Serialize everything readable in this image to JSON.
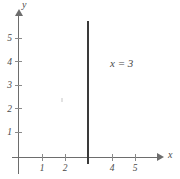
{
  "chart_data": {
    "type": "line",
    "title": "",
    "xlabel": "x",
    "ylabel": "y",
    "xlim": [
      0,
      6
    ],
    "ylim": [
      0,
      6
    ],
    "xticks": [
      1,
      2,
      3,
      4,
      5
    ],
    "xtick_labels": [
      "1",
      "2",
      "4",
      "5"
    ],
    "yticks": [
      1,
      2,
      3,
      4,
      5
    ],
    "ytick_labels": [
      "1",
      "2",
      "3",
      "4",
      "5"
    ],
    "grid": false,
    "legend": "none",
    "series": [
      {
        "name": "x = 3",
        "equation": "x = 3",
        "orientation": "vertical",
        "x_value": 3,
        "y_from": 0,
        "y_to": 5.8,
        "color": "#3a3a3a"
      }
    ],
    "annotations": [
      {
        "text": "x = 3",
        "x": 4,
        "y": 4
      }
    ]
  },
  "figure": {
    "axes": {
      "x_name": "x",
      "y_name": "y"
    },
    "x_tick_labels": [
      {
        "label": "1",
        "left": 36
      },
      {
        "label": "2",
        "left": 59
      },
      {
        "label": "4",
        "left": 106
      },
      {
        "label": "5",
        "left": 129
      }
    ],
    "x_ticks": [
      {
        "left": 42
      },
      {
        "left": 65
      },
      {
        "left": 112
      },
      {
        "left": 135
      }
    ],
    "y_tick_labels": [
      {
        "label": "1",
        "top": 127
      },
      {
        "label": "2",
        "top": 104
      },
      {
        "label": "3",
        "top": 80
      },
      {
        "label": "4",
        "top": 57
      },
      {
        "label": "5",
        "top": 33
      }
    ],
    "y_ticks": [
      {
        "top": 132
      },
      {
        "top": 108
      },
      {
        "top": 85
      },
      {
        "top": 61
      },
      {
        "top": 38
      }
    ],
    "curve_label": "x = 3"
  }
}
